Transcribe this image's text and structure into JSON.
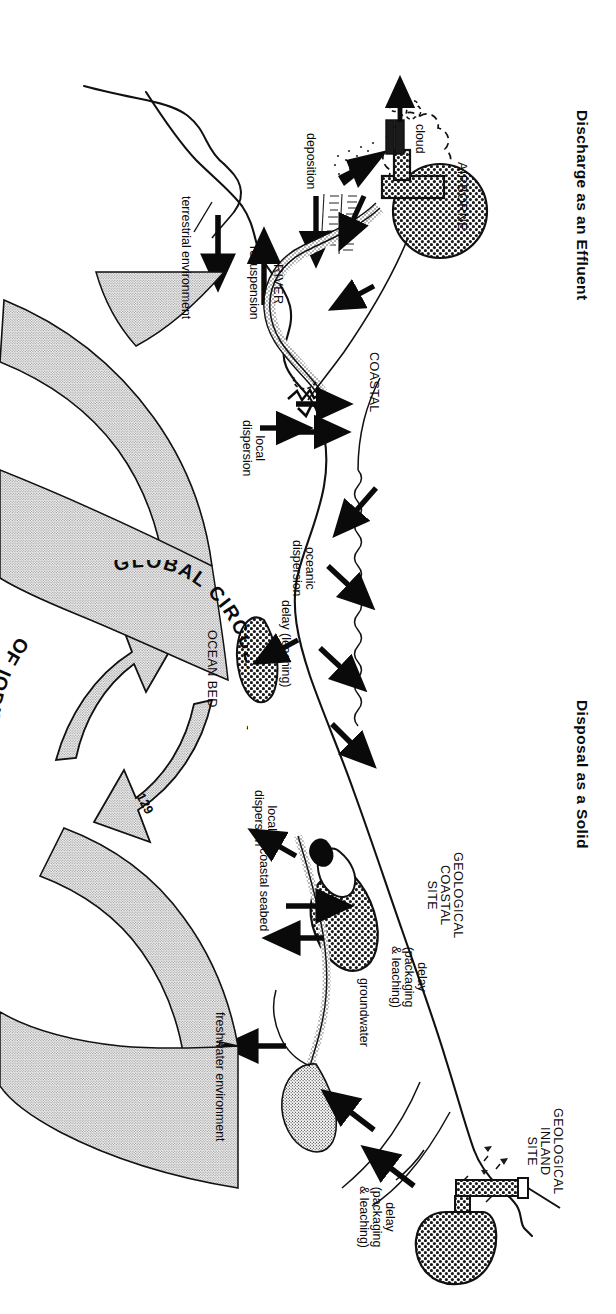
{
  "figure": {
    "kind": "scientific-schematic",
    "orientation": "landscape diagram printed rotated 90 degrees on a portrait page"
  },
  "titles": {
    "left": "Discharge as an Effluent",
    "right": "Disposal as a Solid"
  },
  "site_labels": {
    "airborne": "AIRBORNE",
    "coastal": "COASTAL",
    "river": "RIVER",
    "ocean_bed": "OCEAN BED",
    "geological_coastal": "GEOLOGICAL\nCOASTAL\nSITE",
    "geological_inland": "GEOLOGICAL\nINLAND\nSITE"
  },
  "process_labels": {
    "cloud": "cloud",
    "deposition": "deposition",
    "resuspension": "resuspension",
    "terrestrial_environment": "terrestrial environment",
    "local_dispersion_left": "local\ndispersion",
    "oceanic_dispersion": "oceanic\ndispersion",
    "local_dispersion_right": "local\ndispersion",
    "delay_leaching": "delay (leaching)",
    "coastal_seabed": "coastal seabed",
    "groundwater": "groundwater",
    "freshwater_environment": "freshwater environment",
    "delay_packaging_coastal": "delay\n(packaging\n& leaching)",
    "delay_packaging_inland": "delay\n(packaging\n& leaching)"
  },
  "circulation": {
    "line1": "GLOBAL CIRCULATION",
    "line2": "OF IODINE",
    "isotope": "129"
  },
  "colors": {
    "ink": "#0a0a0a",
    "paper": "#ffffff",
    "stipple_fill": "#b8b8b8",
    "stipple_dark": "#5a5a5a"
  }
}
